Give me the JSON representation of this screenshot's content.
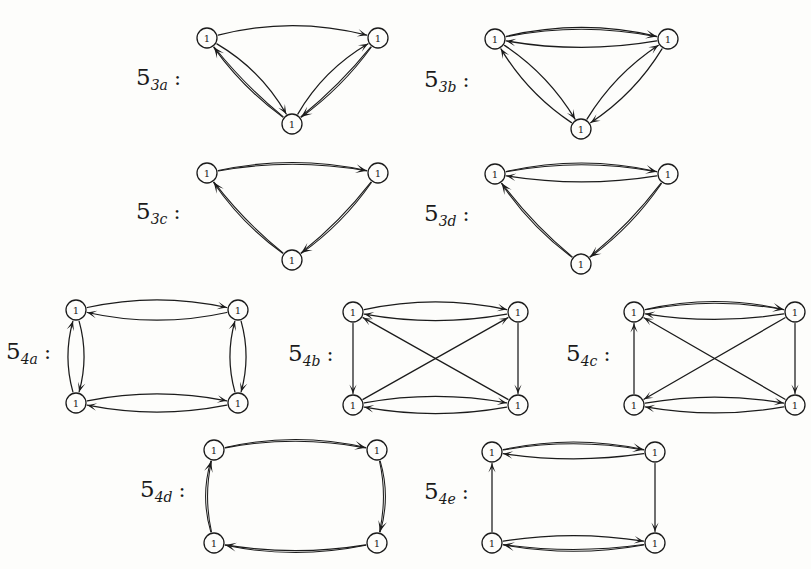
{
  "page": {
    "kind": "mathematical-figure",
    "background_color": "#fdfdfb",
    "ink_color": "#1b1b1b",
    "partial_header_text": "· · · ·",
    "vertex_label": "1"
  },
  "figures": [
    {
      "id": "5_3a",
      "label_base": "5",
      "label_sub": "3a",
      "label_colon": ":",
      "node_count": 3,
      "shape": "triangle",
      "nodes": [
        {
          "name": "top-left",
          "label": "1",
          "x": 207,
          "y": 38
        },
        {
          "name": "top-right",
          "label": "1",
          "x": 378,
          "y": 38
        },
        {
          "name": "bottom",
          "label": "1",
          "x": 292,
          "y": 124
        }
      ],
      "edges": [
        {
          "from": "top-left",
          "to": "top-right",
          "style": "single",
          "bow": -22
        },
        {
          "from": "top-left",
          "to": "bottom",
          "style": "single",
          "bow": -16
        },
        {
          "from": "bottom",
          "to": "top-left",
          "style": "double",
          "bow": -8
        },
        {
          "from": "bottom",
          "to": "top-right",
          "style": "single",
          "bow": -16
        },
        {
          "from": "top-right",
          "to": "bottom",
          "style": "double",
          "bow": -8
        }
      ]
    },
    {
      "id": "5_3b",
      "label_base": "5",
      "label_sub": "3b",
      "label_colon": ":",
      "node_count": 3,
      "shape": "triangle",
      "nodes": [
        {
          "name": "top-left",
          "label": "1",
          "x": 495,
          "y": 39
        },
        {
          "name": "top-right",
          "label": "1",
          "x": 668,
          "y": 39
        },
        {
          "name": "bottom",
          "label": "1",
          "x": 581,
          "y": 129
        }
      ],
      "edges": [
        {
          "from": "top-left",
          "to": "top-right",
          "style": "double",
          "bow": -19
        },
        {
          "from": "top-right",
          "to": "top-left",
          "style": "single",
          "bow": -15
        },
        {
          "from": "top-left",
          "to": "bottom",
          "style": "single",
          "bow": -14
        },
        {
          "from": "bottom",
          "to": "top-left",
          "style": "single",
          "bow": -14
        },
        {
          "from": "top-right",
          "to": "bottom",
          "style": "single",
          "bow": -14
        },
        {
          "from": "bottom",
          "to": "top-right",
          "style": "single",
          "bow": -14
        }
      ]
    },
    {
      "id": "5_3c",
      "label_base": "5",
      "label_sub": "3c",
      "label_colon": ":",
      "node_count": 3,
      "shape": "triangle",
      "nodes": [
        {
          "name": "top-left",
          "label": "1",
          "x": 207,
          "y": 173
        },
        {
          "name": "top-right",
          "label": "1",
          "x": 378,
          "y": 173
        },
        {
          "name": "bottom",
          "label": "1",
          "x": 292,
          "y": 260
        }
      ],
      "edges": [
        {
          "from": "top-left",
          "to": "top-right",
          "style": "double",
          "bow": -17
        },
        {
          "from": "top-right",
          "to": "bottom",
          "style": "double",
          "bow": -9
        },
        {
          "from": "bottom",
          "to": "top-left",
          "style": "double",
          "bow": -9
        }
      ]
    },
    {
      "id": "5_3d",
      "label_base": "5",
      "label_sub": "3d",
      "label_colon": ":",
      "node_count": 3,
      "shape": "triangle",
      "nodes": [
        {
          "name": "top-left",
          "label": "1",
          "x": 495,
          "y": 174
        },
        {
          "name": "top-right",
          "label": "1",
          "x": 668,
          "y": 174
        },
        {
          "name": "bottom",
          "label": "1",
          "x": 581,
          "y": 264
        }
      ],
      "edges": [
        {
          "from": "top-left",
          "to": "top-right",
          "style": "double",
          "bow": -18
        },
        {
          "from": "top-right",
          "to": "top-left",
          "style": "single",
          "bow": -14
        },
        {
          "from": "top-right",
          "to": "bottom",
          "style": "double",
          "bow": -9
        },
        {
          "from": "bottom",
          "to": "top-left",
          "style": "double",
          "bow": -9
        }
      ]
    },
    {
      "id": "5_4a",
      "label_base": "5",
      "label_sub": "4a",
      "label_colon": ":",
      "node_count": 4,
      "shape": "rectangle",
      "nodes": [
        {
          "name": "top-left",
          "label": "1",
          "x": 76,
          "y": 310
        },
        {
          "name": "top-right",
          "label": "1",
          "x": 238,
          "y": 310
        },
        {
          "name": "bottom-left",
          "label": "1",
          "x": 76,
          "y": 403
        },
        {
          "name": "bottom-right",
          "label": "1",
          "x": 238,
          "y": 403
        }
      ],
      "edges": [
        {
          "from": "top-left",
          "to": "top-right",
          "style": "single",
          "bow": -18
        },
        {
          "from": "top-right",
          "to": "top-left",
          "style": "single",
          "bow": -18
        },
        {
          "from": "bottom-left",
          "to": "bottom-right",
          "style": "single",
          "bow": -16
        },
        {
          "from": "bottom-right",
          "to": "bottom-left",
          "style": "single",
          "bow": -16
        },
        {
          "from": "top-left",
          "to": "bottom-left",
          "style": "single",
          "bow": -13
        },
        {
          "from": "bottom-left",
          "to": "top-left",
          "style": "single",
          "bow": -13
        },
        {
          "from": "top-right",
          "to": "bottom-right",
          "style": "single",
          "bow": -13
        },
        {
          "from": "bottom-right",
          "to": "top-right",
          "style": "single",
          "bow": -13
        }
      ]
    },
    {
      "id": "5_4b",
      "label_base": "5",
      "label_sub": "4b",
      "label_colon": ":",
      "node_count": 4,
      "shape": "rectangle-with-diagonals",
      "nodes": [
        {
          "name": "top-left",
          "label": "1",
          "x": 353,
          "y": 312
        },
        {
          "name": "top-right",
          "label": "1",
          "x": 518,
          "y": 312
        },
        {
          "name": "bottom-left",
          "label": "1",
          "x": 353,
          "y": 405
        },
        {
          "name": "bottom-right",
          "label": "1",
          "x": 518,
          "y": 405
        }
      ],
      "edges": [
        {
          "from": "top-left",
          "to": "top-right",
          "style": "single",
          "bow": -18
        },
        {
          "from": "top-right",
          "to": "top-left",
          "style": "single",
          "bow": -15
        },
        {
          "from": "bottom-left",
          "to": "bottom-right",
          "style": "single",
          "bow": -15
        },
        {
          "from": "bottom-right",
          "to": "bottom-left",
          "style": "single",
          "bow": -15
        },
        {
          "from": "top-left",
          "to": "bottom-left",
          "style": "straight",
          "bow": 0
        },
        {
          "from": "top-right",
          "to": "bottom-right",
          "style": "straight",
          "bow": 0
        },
        {
          "from": "bottom-right",
          "to": "top-left",
          "style": "straight",
          "bow": 0
        },
        {
          "from": "bottom-left",
          "to": "top-right",
          "style": "straight",
          "bow": 0
        }
      ]
    },
    {
      "id": "5_4c",
      "label_base": "5",
      "label_sub": "4c",
      "label_colon": ":",
      "node_count": 4,
      "shape": "rectangle-with-diagonals",
      "nodes": [
        {
          "name": "top-left",
          "label": "1",
          "x": 634,
          "y": 312
        },
        {
          "name": "top-right",
          "label": "1",
          "x": 795,
          "y": 312
        },
        {
          "name": "bottom-left",
          "label": "1",
          "x": 634,
          "y": 405
        },
        {
          "name": "bottom-right",
          "label": "1",
          "x": 795,
          "y": 405
        }
      ],
      "edges": [
        {
          "from": "top-left",
          "to": "top-right",
          "style": "double",
          "bow": -17
        },
        {
          "from": "top-right",
          "to": "top-left",
          "style": "single",
          "bow": -13
        },
        {
          "from": "bottom-left",
          "to": "bottom-right",
          "style": "single",
          "bow": -14
        },
        {
          "from": "bottom-right",
          "to": "bottom-left",
          "style": "single",
          "bow": -14
        },
        {
          "from": "bottom-left",
          "to": "top-left",
          "style": "straight",
          "bow": 0
        },
        {
          "from": "top-right",
          "to": "bottom-right",
          "style": "straight",
          "bow": 0
        },
        {
          "from": "bottom-right",
          "to": "top-left",
          "style": "straight",
          "bow": 0
        },
        {
          "from": "top-right",
          "to": "bottom-left",
          "style": "straight",
          "bow": 0
        }
      ]
    },
    {
      "id": "5_4d",
      "label_base": "5",
      "label_sub": "4d",
      "label_colon": ":",
      "node_count": 4,
      "shape": "cycle",
      "nodes": [
        {
          "name": "top-left",
          "label": "1",
          "x": 214,
          "y": 450
        },
        {
          "name": "top-right",
          "label": "1",
          "x": 377,
          "y": 450
        },
        {
          "name": "bottom-left",
          "label": "1",
          "x": 214,
          "y": 543
        },
        {
          "name": "bottom-right",
          "label": "1",
          "x": 377,
          "y": 543
        }
      ],
      "edges": [
        {
          "from": "top-left",
          "to": "top-right",
          "style": "double",
          "bow": -17
        },
        {
          "from": "top-right",
          "to": "bottom-right",
          "style": "double",
          "bow": -12
        },
        {
          "from": "bottom-right",
          "to": "bottom-left",
          "style": "double",
          "bow": -15
        },
        {
          "from": "bottom-left",
          "to": "top-left",
          "style": "double",
          "bow": -12
        }
      ]
    },
    {
      "id": "5_4e",
      "label_base": "5",
      "label_sub": "4e",
      "label_colon": ":",
      "node_count": 4,
      "shape": "rectangle",
      "nodes": [
        {
          "name": "top-left",
          "label": "1",
          "x": 492,
          "y": 452
        },
        {
          "name": "top-right",
          "label": "1",
          "x": 655,
          "y": 452
        },
        {
          "name": "bottom-left",
          "label": "1",
          "x": 492,
          "y": 543
        },
        {
          "name": "bottom-right",
          "label": "1",
          "x": 655,
          "y": 543
        }
      ],
      "edges": [
        {
          "from": "top-left",
          "to": "top-right",
          "style": "double",
          "bow": -16
        },
        {
          "from": "top-right",
          "to": "top-left",
          "style": "single",
          "bow": -12
        },
        {
          "from": "bottom-left",
          "to": "bottom-right",
          "style": "single",
          "bow": -13
        },
        {
          "from": "bottom-right",
          "to": "bottom-left",
          "style": "double",
          "bow": -13
        },
        {
          "from": "bottom-left",
          "to": "top-left",
          "style": "straight",
          "bow": 0
        },
        {
          "from": "top-right",
          "to": "bottom-right",
          "style": "straight",
          "bow": 0
        }
      ]
    }
  ],
  "labels": [
    {
      "for": "5_3a",
      "x": 136,
      "y": 66
    },
    {
      "for": "5_3b",
      "x": 424,
      "y": 68
    },
    {
      "for": "5_3c",
      "x": 136,
      "y": 200
    },
    {
      "for": "5_3d",
      "x": 424,
      "y": 202
    },
    {
      "for": "5_4a",
      "x": 6,
      "y": 340
    },
    {
      "for": "5_4b",
      "x": 288,
      "y": 342
    },
    {
      "for": "5_4c",
      "x": 566,
      "y": 342
    },
    {
      "for": "5_4d",
      "x": 140,
      "y": 478
    },
    {
      "for": "5_4e",
      "x": 424,
      "y": 480
    }
  ]
}
